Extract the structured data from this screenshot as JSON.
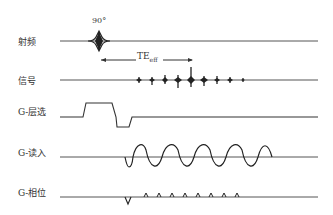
{
  "diagram": {
    "type": "pulse-sequence-timing",
    "rows": [
      {
        "id": "rf",
        "label": "射频",
        "baseline_y": 41
      },
      {
        "id": "signal",
        "label": "信号",
        "baseline_y": 80
      },
      {
        "id": "g_slice",
        "label": "G-层选",
        "baseline_y": 117
      },
      {
        "id": "g_read",
        "label": "G-读入",
        "baseline_y": 157
      },
      {
        "id": "g_phase",
        "label": "G-相位",
        "baseline_y": 197
      }
    ],
    "annotations": {
      "rf_pulse": "90°",
      "te_label": "TE",
      "te_subscript": "eff"
    },
    "signal_echo_count": 9,
    "readout_lobes": 5,
    "phase_blips": 8,
    "line_color": "#333333"
  }
}
